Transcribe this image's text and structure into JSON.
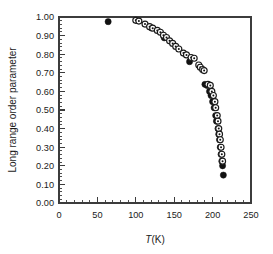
{
  "chart_data": {
    "type": "scatter",
    "title": "",
    "xlabel": "T(K)",
    "ylabel": "Long range order parameter",
    "xlim": [
      0,
      250
    ],
    "ylim": [
      0.0,
      1.0
    ],
    "xticks": [
      0,
      50,
      100,
      150,
      200,
      250
    ],
    "xtick_labels": [
      "0",
      "50",
      "100",
      "150",
      "200",
      "250"
    ],
    "yticks": [
      0.0,
      0.1,
      0.2,
      0.3,
      0.4,
      0.5,
      0.6,
      0.7,
      0.8,
      0.9,
      1.0
    ],
    "ytick_labels": [
      "0.00",
      "0.10",
      "0.20",
      "0.30",
      "0.40",
      "0.50",
      "0.60",
      "0.70",
      "0.80",
      "0.90",
      "1.00"
    ],
    "x_minor_tick_step": 10,
    "y_minor_tick_step": 0.02,
    "grid": false,
    "legend": false,
    "legend_position": "none",
    "frame": "box",
    "series": [
      {
        "name": "filled-circles",
        "marker": "filled-circle",
        "color": "#111111",
        "points": [
          {
            "x": 64,
            "y": 0.975
          },
          {
            "x": 120,
            "y": 0.942
          },
          {
            "x": 137,
            "y": 0.888
          },
          {
            "x": 170,
            "y": 0.76
          },
          {
            "x": 190,
            "y": 0.638
          },
          {
            "x": 193,
            "y": 0.632
          },
          {
            "x": 196,
            "y": 0.6
          },
          {
            "x": 198,
            "y": 0.578
          },
          {
            "x": 200,
            "y": 0.545
          },
          {
            "x": 202,
            "y": 0.512
          },
          {
            "x": 204,
            "y": 0.47
          },
          {
            "x": 205,
            "y": 0.44
          },
          {
            "x": 207,
            "y": 0.4
          },
          {
            "x": 208,
            "y": 0.37
          },
          {
            "x": 209,
            "y": 0.34
          },
          {
            "x": 210,
            "y": 0.3
          },
          {
            "x": 211,
            "y": 0.262
          },
          {
            "x": 212,
            "y": 0.225
          },
          {
            "x": 213,
            "y": 0.2
          },
          {
            "x": 214,
            "y": 0.15
          }
        ]
      },
      {
        "name": "open-circles-with-center-dot",
        "marker": "open-circle-dot",
        "color": "#1a1a1a",
        "points": [
          {
            "x": 100,
            "y": 0.982
          },
          {
            "x": 104,
            "y": 0.978
          },
          {
            "x": 112,
            "y": 0.962
          },
          {
            "x": 118,
            "y": 0.948
          },
          {
            "x": 122,
            "y": 0.94
          },
          {
            "x": 128,
            "y": 0.928
          },
          {
            "x": 132,
            "y": 0.918
          },
          {
            "x": 136,
            "y": 0.902
          },
          {
            "x": 140,
            "y": 0.89
          },
          {
            "x": 144,
            "y": 0.872
          },
          {
            "x": 148,
            "y": 0.858
          },
          {
            "x": 152,
            "y": 0.842
          },
          {
            "x": 156,
            "y": 0.828
          },
          {
            "x": 162,
            "y": 0.806
          },
          {
            "x": 166,
            "y": 0.796
          },
          {
            "x": 172,
            "y": 0.782
          },
          {
            "x": 176,
            "y": 0.778
          },
          {
            "x": 182,
            "y": 0.742
          },
          {
            "x": 184,
            "y": 0.73
          },
          {
            "x": 187,
            "y": 0.718
          },
          {
            "x": 189,
            "y": 0.712
          },
          {
            "x": 194,
            "y": 0.638
          },
          {
            "x": 197,
            "y": 0.632
          },
          {
            "x": 199,
            "y": 0.6
          },
          {
            "x": 201,
            "y": 0.578
          },
          {
            "x": 203,
            "y": 0.545
          },
          {
            "x": 204,
            "y": 0.512
          },
          {
            "x": 206,
            "y": 0.47
          },
          {
            "x": 207,
            "y": 0.44
          },
          {
            "x": 208,
            "y": 0.4
          },
          {
            "x": 209,
            "y": 0.37
          },
          {
            "x": 210,
            "y": 0.34
          },
          {
            "x": 211,
            "y": 0.3
          },
          {
            "x": 212,
            "y": 0.262
          },
          {
            "x": 213,
            "y": 0.225
          }
        ]
      }
    ]
  },
  "geometry": {
    "plot_left": 59,
    "plot_right": 251,
    "plot_top": 17,
    "plot_bottom": 203
  }
}
